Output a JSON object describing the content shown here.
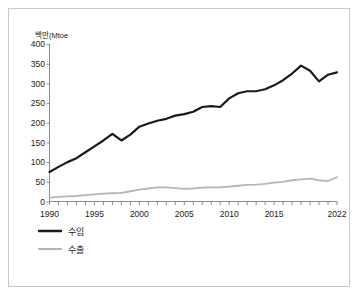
{
  "chart_data": {
    "type": "line",
    "title": "",
    "xlabel": "",
    "ylabel": "백만(Mtoe",
    "ylim": [
      0,
      400
    ],
    "xlim": [
      1990,
      2022
    ],
    "grid": false,
    "legend_position": "bottom-left",
    "y_ticks": [
      0,
      50,
      100,
      150,
      200,
      250,
      300,
      350,
      400
    ],
    "x_ticks_labeled": [
      1990,
      1995,
      2000,
      2005,
      2010,
      2015,
      2022
    ],
    "x": [
      1990,
      1991,
      1992,
      1993,
      1994,
      1995,
      1996,
      1997,
      1998,
      1999,
      2000,
      2001,
      2002,
      2003,
      2004,
      2005,
      2006,
      2007,
      2008,
      2009,
      2010,
      2011,
      2012,
      2013,
      2014,
      2015,
      2016,
      2017,
      2018,
      2019,
      2020,
      2021,
      2022
    ],
    "series": [
      {
        "name": "수입",
        "color": "#1a1a1a",
        "values": [
          75,
          88,
          100,
          110,
          125,
          140,
          155,
          172,
          155,
          170,
          190,
          198,
          205,
          210,
          218,
          222,
          228,
          240,
          242,
          240,
          262,
          275,
          280,
          280,
          285,
          295,
          308,
          325,
          345,
          332,
          305,
          322,
          328
        ]
      },
      {
        "name": "수출",
        "color": "#b5b5b5",
        "values": [
          10,
          12,
          13,
          14,
          16,
          18,
          20,
          21,
          22,
          26,
          30,
          33,
          36,
          36,
          34,
          32,
          33,
          35,
          36,
          36,
          38,
          40,
          42,
          43,
          45,
          48,
          50,
          54,
          56,
          58,
          54,
          52,
          62
        ]
      }
    ]
  },
  "legend": {
    "items": [
      {
        "label": "수입",
        "color": "#1a1a1a"
      },
      {
        "label": "수출",
        "color": "#b5b5b5"
      }
    ]
  }
}
